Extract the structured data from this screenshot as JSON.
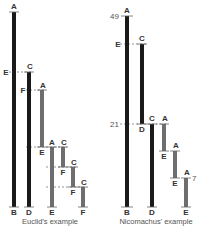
{
  "colors": {
    "dark_bar": "#1a1a1a",
    "grey_bar": "#6e6e6e",
    "background": "#ffffff"
  },
  "euclid": {
    "caption": "Euclid's example",
    "bars": [
      {
        "id": "AB",
        "top_label": "A",
        "bottom_label": "B",
        "x": 12,
        "y1": 12,
        "y2": 207,
        "shade": "dark"
      },
      {
        "id": "CD",
        "top_label": "C",
        "bottom_label": "D",
        "x": 27,
        "y1": 72,
        "y2": 207,
        "shade": "dark"
      },
      {
        "id": "AE1",
        "top_label": "A",
        "bottom_label": "E",
        "x": 40,
        "y1": 90,
        "y2": 147,
        "shade": "grey"
      },
      {
        "id": "AE2",
        "top_label": "A",
        "bottom_label": "E",
        "x": 50,
        "y1": 147,
        "y2": 207,
        "shade": "grey"
      },
      {
        "id": "CF1",
        "top_label": "C",
        "bottom_label": "F",
        "x": 61,
        "y1": 147,
        "y2": 167,
        "shade": "grey"
      },
      {
        "id": "CF2",
        "top_label": "C",
        "bottom_label": "F",
        "x": 71,
        "y1": 167,
        "y2": 187,
        "shade": "grey"
      },
      {
        "id": "CF3",
        "top_label": "C",
        "bottom_label": "F",
        "x": 81,
        "y1": 187,
        "y2": 207,
        "shade": "grey"
      }
    ],
    "side_labels": [
      {
        "text": "E",
        "y": 72
      },
      {
        "text": "F",
        "y": 90
      }
    ]
  },
  "nicomachus": {
    "caption": "Nicomachus' example",
    "bars": [
      {
        "id": "AB",
        "top_label": "A",
        "bottom_label": "B",
        "x": 125,
        "y1": 16,
        "y2": 207,
        "shade": "dark"
      },
      {
        "id": "CD1",
        "top_label": "C",
        "bottom_label": "D",
        "x": 140,
        "y1": 44,
        "y2": 124,
        "shade": "dark"
      },
      {
        "id": "CD2",
        "top_label": "C",
        "bottom_label": "D",
        "x": 150,
        "y1": 124,
        "y2": 207,
        "shade": "dark"
      },
      {
        "id": "AE1",
        "top_label": "A",
        "bottom_label": "E",
        "x": 162,
        "y1": 124,
        "y2": 151,
        "shade": "grey"
      },
      {
        "id": "AE2",
        "top_label": "A",
        "bottom_label": "E",
        "x": 173,
        "y1": 151,
        "y2": 178,
        "shade": "grey"
      },
      {
        "id": "AE3",
        "top_label": "A",
        "bottom_label": "E",
        "x": 184,
        "y1": 178,
        "y2": 207,
        "shade": "grey"
      }
    ],
    "numbers": {
      "top": "49",
      "middle": "21",
      "bottom": "7"
    },
    "side_labels": [
      {
        "text": "E",
        "y": 44
      }
    ]
  }
}
